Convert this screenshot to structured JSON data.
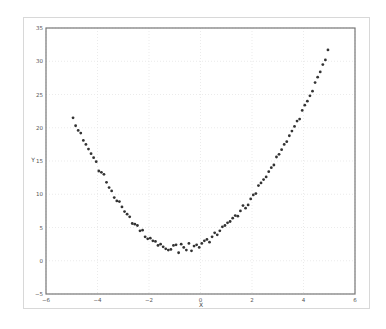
{
  "chart_data": {
    "type": "scatter",
    "title": "",
    "xlabel": "X",
    "ylabel": "Y",
    "xlim": [
      -6,
      6
    ],
    "ylim": [
      -5,
      35
    ],
    "xticks": [
      -6,
      -4,
      -2,
      0,
      2,
      4,
      6
    ],
    "yticks": [
      -5,
      0,
      5,
      10,
      15,
      20,
      25,
      30,
      35
    ],
    "xtick_labels": [
      "−6",
      "−4",
      "−2",
      "0",
      "2",
      "4",
      "6"
    ],
    "ytick_labels": [
      "−5",
      "0",
      "5",
      "10",
      "15",
      "20",
      "25",
      "30",
      "35"
    ],
    "grid": true,
    "legend": null,
    "marker_color": "#333333",
    "series": [
      {
        "name": "data",
        "x": [
          -4.95,
          -4.85,
          -4.75,
          -4.65,
          -4.55,
          -4.45,
          -4.35,
          -4.25,
          -4.15,
          -4.05,
          -3.95,
          -3.85,
          -3.75,
          -3.65,
          -3.55,
          -3.45,
          -3.35,
          -3.25,
          -3.15,
          -3.05,
          -2.95,
          -2.85,
          -2.75,
          -2.65,
          -2.55,
          -2.45,
          -2.35,
          -2.25,
          -2.15,
          -2.05,
          -1.95,
          -1.85,
          -1.75,
          -1.65,
          -1.55,
          -1.45,
          -1.35,
          -1.25,
          -1.15,
          -1.05,
          -0.95,
          -0.85,
          -0.75,
          -0.65,
          -0.55,
          -0.45,
          -0.35,
          -0.25,
          -0.15,
          -0.05,
          0.05,
          0.15,
          0.25,
          0.35,
          0.45,
          0.55,
          0.65,
          0.75,
          0.85,
          0.95,
          1.05,
          1.15,
          1.25,
          1.35,
          1.45,
          1.55,
          1.65,
          1.75,
          1.85,
          1.95,
          2.05,
          2.15,
          2.25,
          2.35,
          2.45,
          2.55,
          2.65,
          2.75,
          2.85,
          2.95,
          3.05,
          3.15,
          3.25,
          3.35,
          3.45,
          3.55,
          3.65,
          3.75,
          3.85,
          3.95,
          4.05,
          4.15,
          4.25,
          4.35,
          4.45,
          4.55,
          4.65,
          4.75,
          4.85,
          4.95
        ],
        "y": [
          21.5,
          20.3,
          19.6,
          19.2,
          18.1,
          17.5,
          16.8,
          16.1,
          15.5,
          14.9,
          13.5,
          13.3,
          13.0,
          11.8,
          11.0,
          10.5,
          9.5,
          9.0,
          8.9,
          8.1,
          7.4,
          7.0,
          6.6,
          5.6,
          5.5,
          5.3,
          4.5,
          4.6,
          3.6,
          3.3,
          3.4,
          3.0,
          2.9,
          2.3,
          2.5,
          2.1,
          1.8,
          1.6,
          1.7,
          2.3,
          2.4,
          1.2,
          2.5,
          2.0,
          1.6,
          2.6,
          1.5,
          2.2,
          2.4,
          2.0,
          2.6,
          3.0,
          3.2,
          2.8,
          3.6,
          4.2,
          3.9,
          4.5,
          5.1,
          5.3,
          5.7,
          5.9,
          6.4,
          6.8,
          6.7,
          7.5,
          8.3,
          7.9,
          8.4,
          9.3,
          9.9,
          10.1,
          11.3,
          11.7,
          12.2,
          12.6,
          13.4,
          14.0,
          14.4,
          15.6,
          16.0,
          16.7,
          17.5,
          17.9,
          18.8,
          19.5,
          20.2,
          21.0,
          21.3,
          22.6,
          23.4,
          24.0,
          24.8,
          25.5,
          26.8,
          27.6,
          28.4,
          29.5,
          30.2,
          31.7
        ]
      }
    ]
  }
}
